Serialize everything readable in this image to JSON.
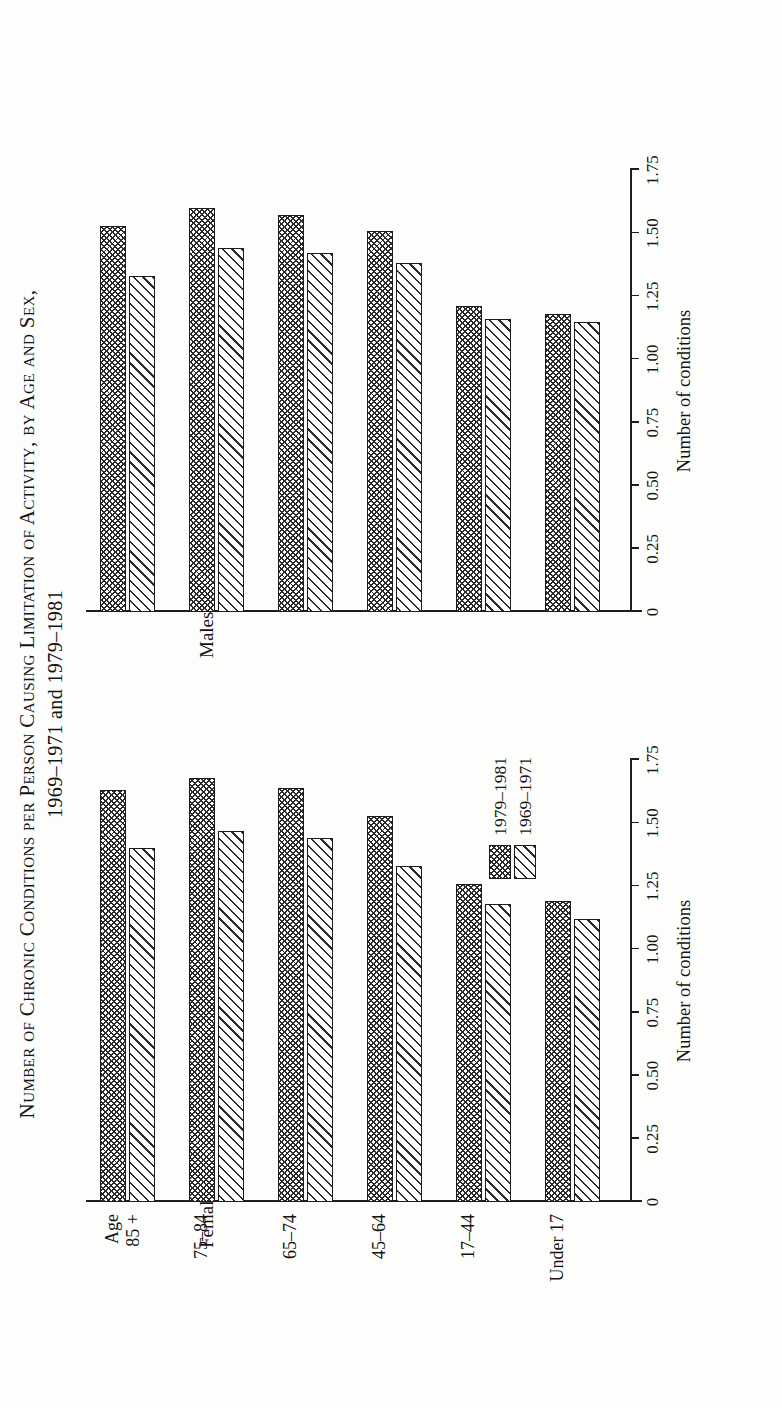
{
  "title": {
    "line1": "Number of Chronic Conditions per Person Causing Limitation of Activity, by Age and Sex,",
    "line2": "1969–1971 and 1979–1981"
  },
  "panels": [
    {
      "key": "females",
      "label": "Females"
    },
    {
      "key": "males",
      "label": "Males"
    }
  ],
  "axis": {
    "title": "Number of conditions",
    "ticks": [
      "0",
      "0.25",
      "0.50",
      "0.75",
      "1.00",
      "1.25",
      "1.50",
      "1.75"
    ],
    "tick_values": [
      0,
      0.25,
      0.5,
      0.75,
      1.0,
      1.25,
      1.5,
      1.75
    ]
  },
  "categories": [
    {
      "line1": "Age",
      "line2": "85 +"
    },
    {
      "line1": "75–84",
      "line2": ""
    },
    {
      "line1": "65–74",
      "line2": ""
    },
    {
      "line1": "45–64",
      "line2": ""
    },
    {
      "line1": "17–44",
      "line2": ""
    },
    {
      "line1": "Under 17",
      "line2": ""
    }
  ],
  "legend": {
    "position": "lower-right-of-females-panel",
    "entries": [
      {
        "label": "1979–1981",
        "pattern": "cross-hatch"
      },
      {
        "label": "1969–1971",
        "pattern": "diagonal-hatch"
      }
    ]
  },
  "colors": {
    "ink": "#1c1c1c",
    "hatch": "#2b2b2b",
    "paper": "#fdfdfb"
  },
  "chart_data": {
    "type": "bar",
    "orientation": "horizontal",
    "title": "Number of Chronic Conditions per Person Causing Limitation of Activity, by Age and Sex, 1969–1971 and 1979–1981",
    "xlabel": "Number of conditions",
    "ylabel": "",
    "xlim": [
      0,
      1.75
    ],
    "grid": false,
    "legend_position": "inside-lower-right",
    "categories": [
      "Age 85 +",
      "75–84",
      "65–74",
      "45–64",
      "17–44",
      "Under 17"
    ],
    "panels": [
      {
        "name": "Females",
        "series": [
          {
            "name": "1979–1981",
            "values": [
              1.63,
              1.68,
              1.64,
              1.53,
              1.26,
              1.19
            ]
          },
          {
            "name": "1969–1971",
            "values": [
              1.4,
              1.47,
              1.44,
              1.33,
              1.18,
              1.12
            ]
          }
        ]
      },
      {
        "name": "Males",
        "series": [
          {
            "name": "1979–1981",
            "values": [
              1.53,
              1.6,
              1.57,
              1.51,
              1.21,
              1.18
            ]
          },
          {
            "name": "1969–1971",
            "values": [
              1.33,
              1.44,
              1.42,
              1.38,
              1.16,
              1.15
            ]
          }
        ]
      }
    ]
  }
}
